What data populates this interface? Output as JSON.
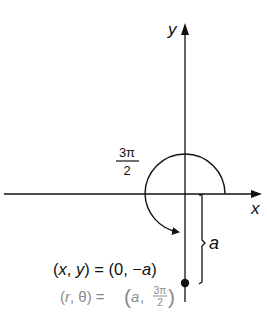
{
  "diagram": {
    "axes": {
      "x_label": "x",
      "y_label": "y"
    },
    "angle_label": {
      "numerator": "3π",
      "denominator": "2"
    },
    "length_label": "a",
    "rect_coords": {
      "lhs_open": "(",
      "lhs_x": "x",
      "lhs_sep": ", ",
      "lhs_y": "y",
      "lhs_close": ")",
      "eq": " = (0, −",
      "rhs_a": "a",
      "rhs_close": ")"
    },
    "polar_coords": {
      "lhs_open": "(",
      "lhs_r": "r",
      "lhs_sep": ", θ) = ",
      "rhs_open": "(",
      "rhs_a": "a",
      "rhs_sep": ",",
      "rhs_num": "3π",
      "rhs_den": "2",
      "rhs_close": ")"
    },
    "colors": {
      "ink": "#111111",
      "polar_text": "#8a8a8a"
    }
  }
}
